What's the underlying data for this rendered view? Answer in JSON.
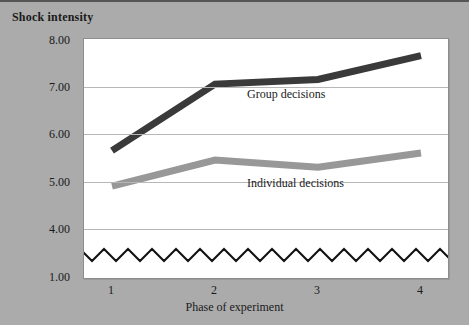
{
  "chart_data": {
    "type": "line",
    "title": "",
    "xlabel": "Phase of experiment",
    "ylabel": "Shock intensity",
    "categories": [
      "1",
      "2",
      "3",
      "4"
    ],
    "x": [
      1,
      2,
      3,
      4
    ],
    "ylim": [
      4.0,
      8.0
    ],
    "axis_break": true,
    "axis_break_note": "y-axis is broken between 1.00 and 4.00; a zigzag line marks the discontinuity",
    "yticks": [
      "8.00",
      "7.00",
      "6.00",
      "5.00",
      "4.00",
      "1.00"
    ],
    "ytick_values": [
      8.0,
      7.0,
      6.0,
      5.0,
      4.0,
      1.0
    ],
    "grid": true,
    "grid_axis": "y",
    "legend_position": "inline-annotation",
    "series": [
      {
        "name": "Group decisions",
        "label": "Group decisions",
        "color": "#3a3a3a",
        "values": [
          5.65,
          7.05,
          7.15,
          7.65
        ]
      },
      {
        "name": "Individual decisions",
        "label": "Individual decisions",
        "color": "#989898",
        "values": [
          4.9,
          5.45,
          5.3,
          5.6
        ]
      }
    ],
    "colors": {
      "background": "#ababab",
      "plot_background": "#ffffff",
      "gridline": "#b7b7b7",
      "border": "#8d8d8d",
      "text": "#1a1a1a",
      "break_line": "#111111"
    }
  }
}
